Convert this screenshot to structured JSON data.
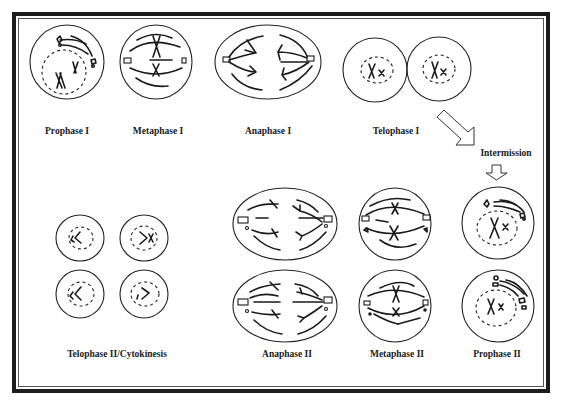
{
  "diagram": {
    "type": "meiosis-stages",
    "labels": {
      "prophase_1": "Prophase I",
      "metaphase_1": "Metaphase I",
      "anaphase_1": "Anaphase I",
      "telophase_1": "Telophase I",
      "intermission": "Intermission",
      "prophase_2": "Prophase II",
      "metaphase_2": "Metaphase II",
      "anaphase_2": "Anaphase II",
      "telophase_2": "Telophase II/Cytokinesis"
    },
    "flow": [
      "Prophase I",
      "Metaphase I",
      "Anaphase I",
      "Telophase I",
      "Intermission",
      "Prophase II",
      "Metaphase II",
      "Anaphase II",
      "Telophase II/Cytokinesis"
    ],
    "colors": {
      "ink": "#1a1a1a",
      "background": "#ffffff",
      "frame": "#1c1c1c"
    }
  }
}
